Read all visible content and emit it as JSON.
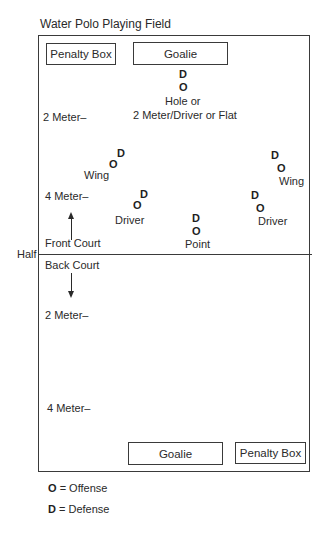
{
  "title": "Water Polo Playing Field",
  "top": {
    "penalty_box": "Penalty Box",
    "goalie": "Goalie"
  },
  "bottom": {
    "goalie": "Goalie",
    "penalty_box": "Penalty Box"
  },
  "markers": {
    "offense": "O",
    "defense": "D"
  },
  "positions": {
    "hole": {
      "label_line1": "Hole or",
      "label_line2": "2 Meter/Driver or Flat"
    },
    "left_wing": {
      "label": "Wing"
    },
    "left_driver": {
      "label": "Driver"
    },
    "point": {
      "label": "Point"
    },
    "right_wing": {
      "label": "Wing"
    },
    "right_driver": {
      "label": "Driver"
    }
  },
  "lines": {
    "top_2m": "2 Meter–",
    "top_4m": "4 Meter–",
    "half": "Half",
    "front_court": "Front Court",
    "back_court": "Back Court",
    "bottom_2m": "2 Meter–",
    "bottom_4m": "4 Meter–"
  },
  "legend": {
    "offense_symbol": "O",
    "offense_text": "= Offense",
    "defense_symbol": "D",
    "defense_text": "= Defense"
  }
}
